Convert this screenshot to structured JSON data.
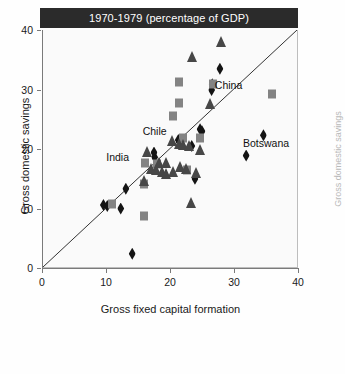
{
  "chart_data": {
    "type": "scatter",
    "title": "1970-1979 (percentage of GDP)",
    "xlabel": "Gross fixed capital formation",
    "ylabel": "Gross domestic savings",
    "xlim": [
      0,
      40
    ],
    "ylim": [
      0,
      40
    ],
    "xticks": [
      "0",
      "10",
      "20",
      "30",
      "40"
    ],
    "yticks": [
      "0",
      "10",
      "20",
      "30",
      "40"
    ],
    "grid": false,
    "legend_position": "none",
    "reference_line": {
      "name": "y = x diagonal",
      "from": [
        0,
        0
      ],
      "to": [
        40,
        40
      ]
    },
    "colors": {
      "header": "#2b2b2b",
      "square": "#838383",
      "triangle": "#474747",
      "diamond": "#141414",
      "plot_background": "#fafafa",
      "axis": "#7a7a7a"
    },
    "series": [
      {
        "name": "diamond",
        "marker": "diamond",
        "color": "#141414",
        "points": [
          [
            9.6,
            10.6
          ],
          [
            10.2,
            10.4
          ],
          [
            12.3,
            10.0
          ],
          [
            13.1,
            13.3
          ],
          [
            14.1,
            2.4
          ],
          [
            17.6,
            18.6
          ],
          [
            17.5,
            19.4
          ],
          [
            21.3,
            21.5
          ],
          [
            23.4,
            20.5
          ],
          [
            23.9,
            15.0
          ],
          [
            24.7,
            23.3
          ],
          [
            25.0,
            23.0
          ],
          [
            26.6,
            30.9
          ],
          [
            26.5,
            29.9
          ],
          [
            27.8,
            33.5
          ],
          [
            31.9,
            18.9
          ],
          [
            34.6,
            22.3
          ]
        ]
      },
      {
        "name": "square",
        "marker": "square",
        "color": "#838383",
        "points": [
          [
            10.9,
            10.7
          ],
          [
            15.9,
            8.8
          ],
          [
            16.0,
            14.2
          ],
          [
            16.1,
            17.7
          ],
          [
            17.9,
            17.4
          ],
          [
            20.5,
            25.5
          ],
          [
            21.4,
            27.7
          ],
          [
            21.4,
            31.3
          ],
          [
            22.0,
            21.9
          ],
          [
            22.6,
            16.4
          ],
          [
            24.7,
            21.9
          ],
          [
            26.7,
            31.0
          ],
          [
            36.0,
            29.2
          ]
        ]
      },
      {
        "name": "triangle",
        "marker": "triangle",
        "color": "#474747",
        "points": [
          [
            15.9,
            14.7
          ],
          [
            16.4,
            19.5
          ],
          [
            17.0,
            16.6
          ],
          [
            17.8,
            16.4
          ],
          [
            18.3,
            17.6
          ],
          [
            18.8,
            16.1
          ],
          [
            19.3,
            15.8
          ],
          [
            19.4,
            17.6
          ],
          [
            20.3,
            21.3
          ],
          [
            20.5,
            16.1
          ],
          [
            21.4,
            20.9
          ],
          [
            21.6,
            17.0
          ],
          [
            22.0,
            20.6
          ],
          [
            22.5,
            16.6
          ],
          [
            23.0,
            20.5
          ],
          [
            23.3,
            11.0
          ],
          [
            23.4,
            35.5
          ],
          [
            24.7,
            19.9
          ],
          [
            26.2,
            27.5
          ],
          [
            27.9,
            38.0
          ],
          [
            24.0,
            15.9
          ]
        ]
      }
    ],
    "annotations": [
      {
        "label": "India",
        "x": 13.6,
        "y": 18.5,
        "anchor": "right"
      },
      {
        "label": "Chile",
        "x": 17.6,
        "y": 22.8,
        "anchor": "center"
      },
      {
        "label": "China",
        "x": 27.0,
        "y": 30.6,
        "anchor": "left"
      },
      {
        "label": "Botswana",
        "x": 31.4,
        "y": 20.8,
        "anchor": "left"
      }
    ]
  },
  "neighbor_panel": {
    "axis_label": "Gross domestic savings"
  }
}
